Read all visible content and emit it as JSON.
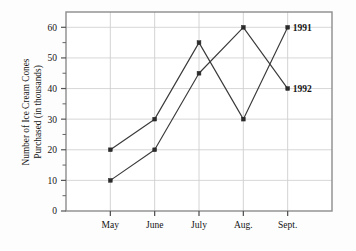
{
  "chart_data": {
    "type": "line",
    "title": "",
    "xlabel": "",
    "ylabel_line1": "Number of Ice Cream Cones",
    "ylabel_line2": "Purchased (in thousands)",
    "categories": [
      "May",
      "June",
      "July",
      "Aug.",
      "Sept."
    ],
    "series": [
      {
        "name": "1991",
        "values": [
          20,
          30,
          55,
          30,
          60
        ]
      },
      {
        "name": "1992",
        "values": [
          10,
          20,
          45,
          60,
          40
        ]
      }
    ],
    "ylim": [
      0,
      65
    ],
    "y_ticks_major": [
      0,
      10,
      20,
      30,
      40,
      50,
      60
    ],
    "y_ticks_minor": [
      5,
      15,
      25,
      35,
      45,
      55
    ],
    "y_tick_labels": [
      "0",
      "10",
      "20",
      "30",
      "40",
      "50",
      "60"
    ],
    "grid": true,
    "grid_horizontal": true,
    "grid_vertical": true,
    "legend_position": "inline-right-of-last-point",
    "marker": "square",
    "line_color": "#3a3a3a",
    "marker_color": "#2b2b2b",
    "grid_color": "#d2d2d2",
    "frame_color": "#8c8c8c",
    "text_color": "#141414",
    "background_color": "#ffffff"
  },
  "labels": {
    "y_axis_title_line1": "Number of Ice Cream Cones",
    "y_axis_title_line2": "Purchased (in thousands)",
    "series_1_label": "1991",
    "series_2_label": "1992",
    "x_may": "May",
    "x_june": "June",
    "x_july": "July",
    "x_aug": "Aug.",
    "x_sept": "Sept.",
    "y_0": "0",
    "y_10": "10",
    "y_20": "20",
    "y_30": "30",
    "y_40": "40",
    "y_50": "50",
    "y_60": "60"
  }
}
